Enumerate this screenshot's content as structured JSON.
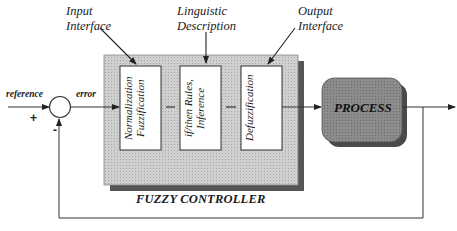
{
  "diagram": {
    "title": "FUZZY CONTROLLER",
    "annotations": {
      "input_interface": [
        "Input",
        "Interface"
      ],
      "linguistic_description": [
        "Linguistic",
        "Description"
      ],
      "output_interface": [
        "Output",
        "Interface"
      ]
    },
    "signals": {
      "reference": "reference",
      "error": "error",
      "plus_sign": "+",
      "minus_sign": "-"
    },
    "blocks": [
      {
        "id": "normalization",
        "lines": [
          "Normalization",
          "Fuzzification"
        ]
      },
      {
        "id": "inference",
        "lines": [
          "if/then Rules,",
          "Inference"
        ]
      },
      {
        "id": "defuzzification",
        "lines": [
          "Defuzzification"
        ]
      }
    ],
    "process": {
      "label": "PROCESS"
    },
    "colors": {
      "controller_fill": "#c8c8c8",
      "controller_shadow": "#555555",
      "process_fill": "#8a8a8a",
      "process_shadow": "#4a4a4a",
      "line": "#333333"
    }
  }
}
